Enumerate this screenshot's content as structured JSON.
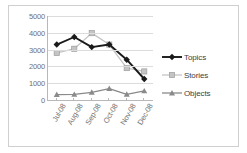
{
  "chart_data": {
    "type": "line",
    "title": "",
    "subtitle": "",
    "xlabel": "",
    "ylabel": "",
    "categories": [
      "Jul-08",
      "Aug-08",
      "Sep-08",
      "Oct-08",
      "Nov-08",
      "Dec-08"
    ],
    "series": [
      {
        "name": "Topics",
        "values": [
          3300,
          3750,
          3150,
          3300,
          2400,
          1250
        ],
        "color": "#1a1a1a",
        "marker": "diamond"
      },
      {
        "name": "Stories",
        "values": [
          2800,
          3050,
          3980,
          3300,
          1900,
          1700
        ],
        "color": "#c4c4c4",
        "marker": "square"
      },
      {
        "name": "Objects",
        "values": [
          320,
          330,
          460,
          680,
          340,
          540
        ],
        "color": "#8a8a8a",
        "marker": "triangle"
      }
    ],
    "ylim": [
      0,
      5000
    ],
    "yticks": [
      0,
      1000,
      2000,
      3000,
      4000,
      5000
    ],
    "ytick_labels": [
      "0",
      "1000",
      "2000",
      "3000",
      "4000",
      "5000"
    ],
    "grid": true,
    "grid_axis": "y",
    "legend_position": "right",
    "plot_background": "#ffffff",
    "gridline_color": "#dcdcdc",
    "axis_color": "#b8b8b8",
    "tick_label_color": "#6f6f6f",
    "frame_border_color": "#cfcfcf"
  },
  "legend": {
    "entries": [
      {
        "label": "Topics"
      },
      {
        "label": "Stories"
      },
      {
        "label": "Objects"
      }
    ]
  }
}
